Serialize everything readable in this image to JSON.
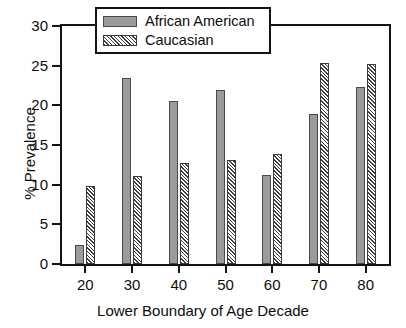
{
  "chart_data": {
    "type": "bar",
    "title": "",
    "subtitle": "",
    "xlabel": "Lower Boundary of Age Decade",
    "ylabel": "% Prevalence",
    "categories": [
      "20",
      "30",
      "40",
      "50",
      "60",
      "70",
      "80"
    ],
    "series": [
      {
        "name": "African American",
        "style": "solid-gray",
        "color": "#9b9b9b",
        "values": [
          2.4,
          23.4,
          20.6,
          21.9,
          11.2,
          18.9,
          22.3
        ]
      },
      {
        "name": "Caucasian",
        "style": "diagonal-hatch",
        "color": "#3d3d3d",
        "values": [
          9.8,
          11.1,
          12.7,
          13.1,
          13.9,
          25.4,
          25.2
        ]
      }
    ],
    "ylim": [
      0,
      30
    ],
    "yticks": [
      0,
      5,
      10,
      15,
      20,
      25,
      30
    ],
    "ytick_labels": [
      "0",
      "5",
      "10",
      "15",
      "20",
      "25",
      "30"
    ],
    "xtick_labels": [
      "20",
      "30",
      "40",
      "50",
      "60",
      "70",
      "80"
    ],
    "grid": false,
    "legend_position": "top-center",
    "legend_entries": [
      "African American",
      "Caucasian"
    ],
    "annotations": []
  },
  "legend": {
    "items": [
      {
        "label": "African American"
      },
      {
        "label": "Caucasian"
      }
    ]
  },
  "axes": {
    "y_title": "% Prevalence",
    "x_title": "Lower Boundary of Age Decade"
  },
  "colors": {
    "axis": "#141414",
    "text": "#0d0d0d",
    "series_solid": "#9b9b9b",
    "series_hatch": "#3d3d3d",
    "background": "#ffffff"
  }
}
